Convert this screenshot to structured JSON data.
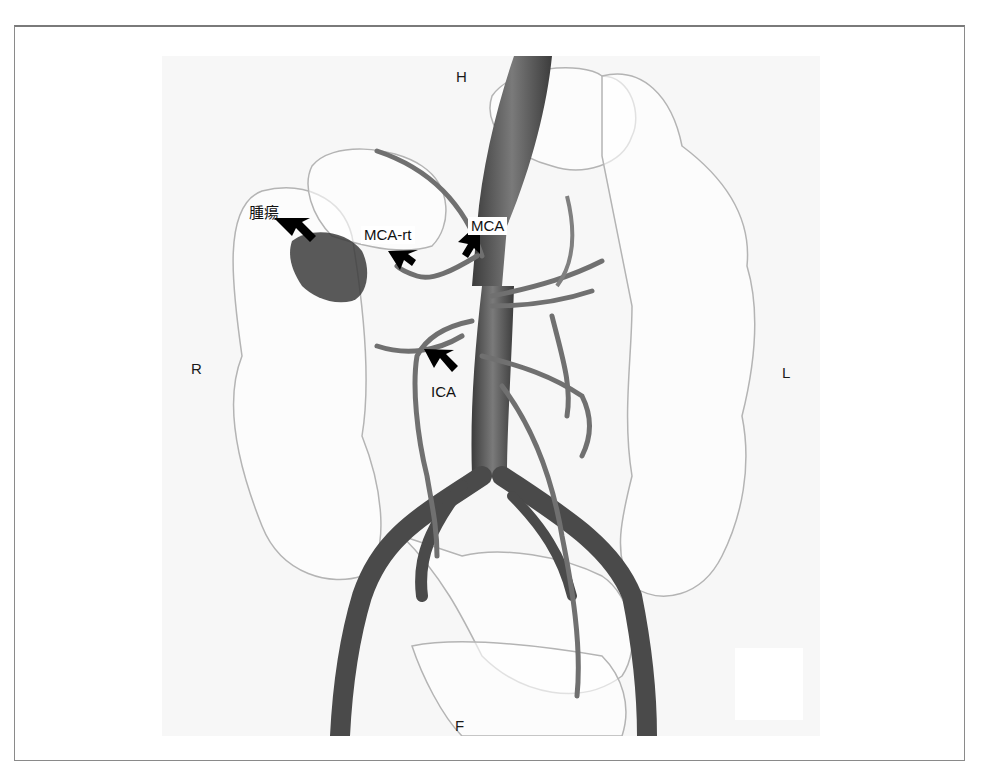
{
  "figure": {
    "orientation_labels": {
      "head": "H",
      "foot": "F",
      "right": "R",
      "left": "L"
    },
    "annotations": [
      {
        "id": "tumor",
        "label": "腫瘍"
      },
      {
        "id": "mca-rt",
        "label": "MCA-rt"
      },
      {
        "id": "mca",
        "label": "MCA"
      },
      {
        "id": "ica",
        "label": "ICA"
      }
    ]
  },
  "colors": {
    "frame_border": "#8a8a8a",
    "vessel": "#5a5a5a",
    "colon_outline": "#b0b0b0",
    "tumor": "#3a3a3a",
    "arrow": "#000000"
  }
}
